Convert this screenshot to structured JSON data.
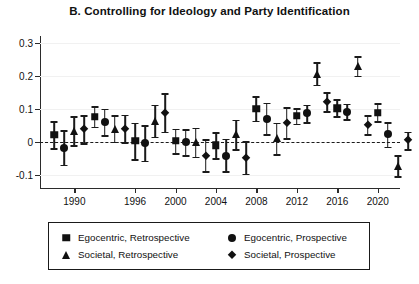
{
  "chart_data": {
    "type": "scatter",
    "title": "B. Controlling for Ideology and Party Identification",
    "xlabel": "",
    "ylabel": "",
    "ylim": [
      -0.14,
      0.32
    ],
    "xlim": [
      1986.6,
      2022.2
    ],
    "yticks": [
      0.3,
      0.2,
      0.1,
      0,
      -0.1
    ],
    "ytick_labels": [
      "0.3",
      "0.2",
      "0.1",
      "0",
      "-0.1"
    ],
    "xticks": [
      1990,
      1996,
      2000,
      2004,
      2008,
      2012,
      2016,
      2020
    ],
    "xtick_labels": [
      "1990",
      "1996",
      "2000",
      "2004",
      "2008",
      "2012",
      "2016",
      "2020"
    ],
    "grid": true,
    "zero_reference_line": 0,
    "error_bars": "95% confidence intervals",
    "legend_position": "below-axes",
    "series": [
      {
        "name": "Egocentric, Retrospective",
        "marker": "square",
        "points": [
          {
            "x": 1988.0,
            "y": 0.021,
            "lo": -0.019,
            "hi": 0.062
          },
          {
            "x": 1992.0,
            "y": 0.076,
            "lo": 0.046,
            "hi": 0.108
          },
          {
            "x": 1996.0,
            "y": 0.003,
            "lo": -0.052,
            "hi": 0.058
          },
          {
            "x": 2000.0,
            "y": 0.003,
            "lo": -0.034,
            "hi": 0.04
          },
          {
            "x": 2004.0,
            "y": -0.01,
            "lo": -0.049,
            "hi": 0.029
          },
          {
            "x": 2008.0,
            "y": 0.1,
            "lo": 0.064,
            "hi": 0.138
          },
          {
            "x": 2012.0,
            "y": 0.078,
            "lo": 0.055,
            "hi": 0.102
          },
          {
            "x": 2016.0,
            "y": 0.102,
            "lo": 0.078,
            "hi": 0.128
          },
          {
            "x": 2020.0,
            "y": 0.088,
            "lo": 0.062,
            "hi": 0.116
          }
        ]
      },
      {
        "name": "Egocentric, Prospective",
        "marker": "circle",
        "points": [
          {
            "x": 1989.0,
            "y": -0.018,
            "lo": -0.07,
            "hi": 0.035
          },
          {
            "x": 1993.0,
            "y": 0.06,
            "lo": 0.02,
            "hi": 0.1
          },
          {
            "x": 1997.0,
            "y": -0.004,
            "lo": -0.057,
            "hi": 0.05
          },
          {
            "x": 2001.0,
            "y": -0.002,
            "lo": -0.041,
            "hi": 0.038
          },
          {
            "x": 2005.0,
            "y": -0.042,
            "lo": -0.09,
            "hi": 0.009
          },
          {
            "x": 2009.0,
            "y": 0.069,
            "lo": 0.022,
            "hi": 0.118
          },
          {
            "x": 2013.0,
            "y": 0.086,
            "lo": 0.06,
            "hi": 0.112
          },
          {
            "x": 2017.0,
            "y": 0.091,
            "lo": 0.068,
            "hi": 0.115
          },
          {
            "x": 2021.0,
            "y": 0.022,
            "lo": -0.015,
            "hi": 0.059
          }
        ]
      },
      {
        "name": "Societal, Retrospective",
        "marker": "triangle",
        "points": [
          {
            "x": 1990.0,
            "y": 0.033,
            "lo": -0.01,
            "hi": 0.078
          },
          {
            "x": 1994.0,
            "y": 0.04,
            "lo": 0.0,
            "hi": 0.081
          },
          {
            "x": 1998.0,
            "y": 0.063,
            "lo": 0.015,
            "hi": 0.112
          },
          {
            "x": 2002.0,
            "y": -0.002,
            "lo": -0.045,
            "hi": 0.042
          },
          {
            "x": 2006.0,
            "y": 0.022,
            "lo": -0.022,
            "hi": 0.067
          },
          {
            "x": 2010.0,
            "y": 0.01,
            "lo": -0.037,
            "hi": 0.057
          },
          {
            "x": 2014.0,
            "y": 0.205,
            "lo": 0.172,
            "hi": 0.24
          },
          {
            "x": 2018.0,
            "y": 0.228,
            "lo": 0.2,
            "hi": 0.258
          },
          {
            "x": 2022.0,
            "y": -0.072,
            "lo": -0.104,
            "hi": -0.041
          }
        ]
      },
      {
        "name": "Societal, Prospective",
        "marker": "diamond",
        "points": [
          {
            "x": 1991.0,
            "y": 0.038,
            "lo": -0.005,
            "hi": 0.081
          },
          {
            "x": 1995.0,
            "y": 0.04,
            "lo": -0.002,
            "hi": 0.082
          },
          {
            "x": 1999.0,
            "y": 0.087,
            "lo": 0.03,
            "hi": 0.146
          },
          {
            "x": 2003.0,
            "y": -0.042,
            "lo": -0.09,
            "hi": 0.008
          },
          {
            "x": 2007.0,
            "y": -0.048,
            "lo": -0.097,
            "hi": 0.002
          },
          {
            "x": 2011.0,
            "y": 0.056,
            "lo": 0.01,
            "hi": 0.104
          },
          {
            "x": 2015.0,
            "y": 0.12,
            "lo": 0.092,
            "hi": 0.15
          },
          {
            "x": 2019.0,
            "y": 0.05,
            "lo": 0.022,
            "hi": 0.08
          },
          {
            "x": 2023.0,
            "y": 0.004,
            "lo": -0.022,
            "hi": 0.03
          }
        ]
      }
    ]
  },
  "legend": {
    "entries": [
      {
        "label": "Egocentric, Retrospective",
        "marker": "square"
      },
      {
        "label": "Egocentric, Prospective",
        "marker": "circle"
      },
      {
        "label": "Societal, Retrospective",
        "marker": "triangle"
      },
      {
        "label": "Societal, Prospective",
        "marker": "diamond"
      }
    ]
  }
}
